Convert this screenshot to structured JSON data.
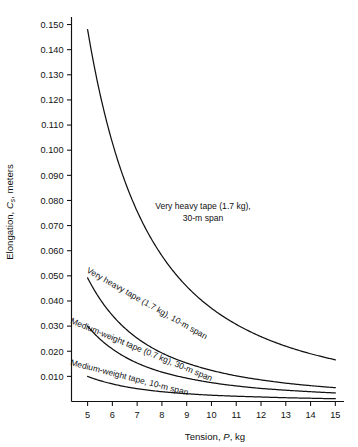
{
  "chart_data": {
    "type": "line",
    "title": "",
    "xlabel": "Tension, P, kg",
    "ylabel": "Elongation, Cs, meters",
    "xlim": [
      4.35,
      15.35
    ],
    "ylim": [
      0.0,
      0.153
    ],
    "grid": false,
    "legend_position": "inline-curve-labels",
    "xticks": [
      "5",
      "6",
      "7",
      "8",
      "9",
      "10",
      "11",
      "12",
      "13",
      "14",
      "15"
    ],
    "xtick_values": [
      5,
      6,
      7,
      8,
      9,
      10,
      11,
      12,
      13,
      14,
      15
    ],
    "yticks": [
      "0.010",
      "0.020",
      "0.030",
      "0.040",
      "0.050",
      "0.060",
      "0.070",
      "0.080",
      "0.090",
      "0.100",
      "0.110",
      "0.120",
      "0.130",
      "0.140",
      "0.150"
    ],
    "ytick_values": [
      0.01,
      0.02,
      0.03,
      0.04,
      0.05,
      0.06,
      0.07,
      0.08,
      0.09,
      0.1,
      0.11,
      0.12,
      0.13,
      0.14,
      0.15
    ],
    "x": [
      5,
      6,
      7,
      8,
      9,
      10,
      11,
      12,
      13,
      14,
      15
    ],
    "series": [
      {
        "name": "Very heavy tape (1.7 kg), 30-m span",
        "label_line1": "Very heavy tape (1.7 kg),",
        "label_line2": "30-m span",
        "values": [
          0.148,
          0.103,
          0.0757,
          0.058,
          0.0458,
          0.0371,
          0.0307,
          0.0258,
          0.022,
          0.019,
          0.0166
        ]
      },
      {
        "name": "Very heavy tape (1.7 kg), 10-m span",
        "label_line1": "Very heavy tape (1.7 kg), 10-m span",
        "values": [
          0.0492,
          0.0343,
          0.0252,
          0.0193,
          0.0153,
          0.0124,
          0.0102,
          0.0086,
          0.0073,
          0.0063,
          0.0055
        ]
      },
      {
        "name": "Medium-weight tape (0.7 kg), 30-m span",
        "label_line1": "Medium-weight tape (0.7 kg), 30-m span",
        "values": [
          0.03,
          0.0209,
          0.0153,
          0.0117,
          0.0093,
          0.0075,
          0.0062,
          0.0052,
          0.0045,
          0.0039,
          0.0034
        ]
      },
      {
        "name": "Medium-weight tape, 10-m span",
        "label_line1": "Medium-weight tape, 10-m span",
        "values": [
          0.01,
          0.007,
          0.0051,
          0.0039,
          0.0031,
          0.0025,
          0.0021,
          0.0018,
          0.0015,
          0.0013,
          0.0011
        ]
      }
    ]
  },
  "axis": {
    "y_title_prefix": "Elongation, ",
    "y_title_symbol": "C",
    "y_title_subscript": "s",
    "y_title_suffix": ", meters",
    "x_title_prefix": "Tension, ",
    "x_title_symbol": "P",
    "x_title_suffix": ", kg"
  },
  "ytick_labels": {
    "t0": "0.010",
    "t1": "0.020",
    "t2": "0.030",
    "t3": "0.040",
    "t4": "0.050",
    "t5": "0.060",
    "t6": "0.070",
    "t7": "0.080",
    "t8": "0.090",
    "t9": "0.100",
    "t10": "0.110",
    "t11": "0.120",
    "t12": "0.130",
    "t13": "0.140",
    "t14": "0.150"
  },
  "xtick_labels": {
    "t0": "5",
    "t1": "6",
    "t2": "7",
    "t3": "8",
    "t4": "9",
    "t5": "10",
    "t6": "11",
    "t7": "12",
    "t8": "13",
    "t9": "14",
    "t10": "15"
  },
  "curve_labels": {
    "c1_line1": "Very heavy tape (1.7 kg),",
    "c1_line2": "30-m span",
    "c2": "Very heavy tape (1.7 kg), 10-m span",
    "c3": "Medium-weight tape (0.7 kg), 30-m span",
    "c4": "Medium-weight tape, 10-m span"
  },
  "colors": {
    "ink": "#111111",
    "background": "#ffffff"
  }
}
